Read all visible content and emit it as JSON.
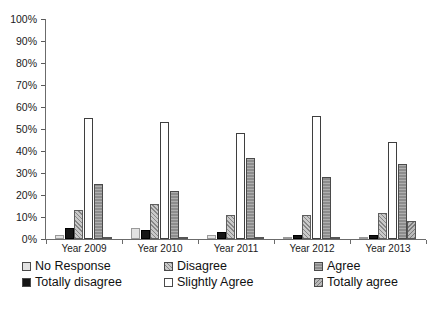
{
  "chart_data": {
    "type": "bar",
    "title": "",
    "subtitle": "",
    "xlabel": "",
    "ylabel": "",
    "ylim": [
      0,
      100
    ],
    "grid": false,
    "legend_position": "bottom",
    "categories": [
      "Year 2009",
      "Year 2010",
      "Year 2011",
      "Year 2012",
      "Year 2013"
    ],
    "y_ticks": [
      "0%",
      "10%",
      "20%",
      "30%",
      "40%",
      "50%",
      "60%",
      "70%",
      "80%",
      "90%",
      "100%"
    ],
    "y_tick_values": [
      0,
      10,
      20,
      30,
      40,
      50,
      60,
      70,
      80,
      90,
      100
    ],
    "series": [
      {
        "name": "No Response",
        "pattern": "solid-light-gray",
        "color": "#e2e2e2",
        "values": [
          2,
          5,
          2,
          1,
          1
        ]
      },
      {
        "name": "Totally disagree",
        "pattern": "solid-black",
        "color": "#151515",
        "values": [
          5,
          4,
          3,
          2,
          2
        ]
      },
      {
        "name": "Disagree",
        "pattern": "forward-diagonal-hatch",
        "color": "#c9c9c9",
        "values": [
          13,
          16,
          11,
          11,
          12
        ]
      },
      {
        "name": "Slightly Agree",
        "pattern": "white-outline",
        "color": "#ffffff",
        "values": [
          55,
          53,
          48,
          56,
          44
        ]
      },
      {
        "name": "Agree",
        "pattern": "horizontal-stripes",
        "color": "#8d8d8d",
        "values": [
          25,
          22,
          37,
          28,
          34
        ]
      },
      {
        "name": "Totally agree",
        "pattern": "backward-diagonal-hatch",
        "color": "#b9b9b9",
        "values": [
          1,
          1,
          1,
          1,
          8
        ]
      }
    ]
  },
  "legend": {
    "entries": [
      {
        "label": "No Response",
        "swatch": "legend-swatch-no-response"
      },
      {
        "label": "Totally disagree",
        "swatch": "legend-swatch-totally-disagree"
      },
      {
        "label": "Disagree",
        "swatch": "legend-swatch-disagree"
      },
      {
        "label": "Slightly Agree",
        "swatch": "legend-swatch-slightly-agree"
      },
      {
        "label": "Agree",
        "swatch": "legend-swatch-agree"
      },
      {
        "label": "Totally agree",
        "swatch": "legend-swatch-totally-agree"
      }
    ]
  }
}
